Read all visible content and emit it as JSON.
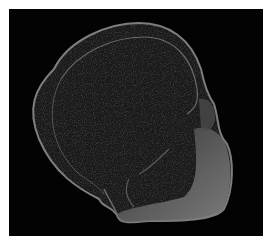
{
  "image": {
    "subject": "grayscale sectional scan of a skull-shaped specimen on black background",
    "colors": {
      "page_background": "#ffffff",
      "frame_background": "#030303",
      "tissue_dark": "#1c1c1c",
      "tissue_edge": "#8a8a8a",
      "tissue_bright": "#7a7a7a"
    }
  }
}
